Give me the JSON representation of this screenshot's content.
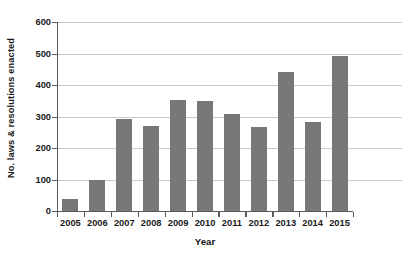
{
  "chart_data": {
    "type": "bar",
    "title": "",
    "subtitle": "",
    "xlabel": "Year",
    "ylabel": "No. laws & resolutions enacted",
    "categories": [
      "2005",
      "2006",
      "2007",
      "2008",
      "2009",
      "2010",
      "2011",
      "2012",
      "2013",
      "2014",
      "2015"
    ],
    "values": [
      38,
      97,
      291,
      271,
      353,
      348,
      307,
      267,
      440,
      282,
      492
    ],
    "series": [
      {
        "name": "No. laws & resolutions enacted",
        "values": [
          38,
          97,
          291,
          271,
          353,
          348,
          307,
          267,
          440,
          282,
          492
        ]
      }
    ],
    "ylim": [
      0,
      600
    ],
    "yticks": [
      0,
      100,
      200,
      300,
      400,
      500,
      600
    ],
    "ytick_labels": [
      "0",
      "100",
      "200",
      "300",
      "400",
      "500",
      "600"
    ],
    "xtick_labels": [
      "2005",
      "2006",
      "2007",
      "2008",
      "2009",
      "2010",
      "2011",
      "2012",
      "2013",
      "2014",
      "2015"
    ],
    "grid": true,
    "grid_axis": "y",
    "legend": false,
    "legend_position": "none",
    "annotations": [],
    "colors": {
      "bar": "#787878",
      "gridline": "#c9c9c9",
      "axis": "#5a5a5a",
      "text": "#1a1a1a",
      "background": "#ffffff"
    }
  }
}
